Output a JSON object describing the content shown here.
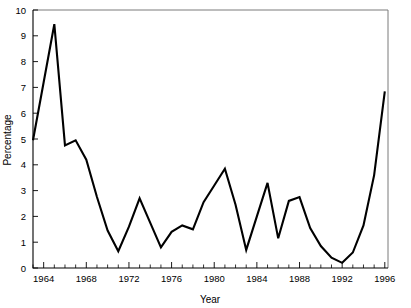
{
  "chart_data": {
    "type": "line",
    "title": "",
    "xlabel": "Year",
    "ylabel": "Percentage",
    "xlim": [
      1963,
      1996.3
    ],
    "ylim": [
      0,
      10
    ],
    "grid": false,
    "legend": "none",
    "x_major_ticks": [
      1964,
      1968,
      1972,
      1976,
      1980,
      1984,
      1988,
      1992,
      1996
    ],
    "x_tick_labels": [
      "1964",
      "1968",
      "1972",
      "1976",
      "1980",
      "1984",
      "1988",
      "1992",
      "1996"
    ],
    "x_minor_tick_interval": 1,
    "y_ticks": [
      0,
      1,
      2,
      3,
      4,
      5,
      6,
      7,
      8,
      9,
      10
    ],
    "y_tick_labels": [
      "0",
      "1",
      "2",
      "3",
      "4",
      "5",
      "6",
      "7",
      "8",
      "9",
      "10"
    ],
    "line_color": "#000000",
    "frame_color": "#7a7a7a",
    "background_color": "#ffffff",
    "x": [
      1963,
      1964,
      1965,
      1966,
      1967,
      1968,
      1969,
      1970,
      1971,
      1972,
      1973,
      1974,
      1975,
      1976,
      1977,
      1978,
      1979,
      1980,
      1981,
      1982,
      1983,
      1984,
      1985,
      1986,
      1987,
      1988,
      1989,
      1990,
      1991,
      1992,
      1993,
      1994,
      1995,
      1996
    ],
    "values": [
      4.95,
      7.2,
      9.45,
      4.75,
      4.95,
      4.2,
      2.75,
      1.45,
      0.65,
      1.6,
      2.7,
      1.75,
      0.8,
      1.4,
      1.65,
      1.5,
      2.55,
      3.2,
      3.85,
      2.45,
      0.7,
      2.0,
      3.3,
      1.15,
      2.6,
      2.75,
      1.55,
      0.85,
      0.4,
      0.2,
      0.6,
      1.65,
      3.6,
      6.85
    ],
    "series": [
      {
        "name": "Percentage",
        "values": [
          4.95,
          7.2,
          9.45,
          4.75,
          4.95,
          4.2,
          2.75,
          1.45,
          0.65,
          1.6,
          2.7,
          1.75,
          0.8,
          1.4,
          1.65,
          1.5,
          2.55,
          3.2,
          3.85,
          2.45,
          0.7,
          2.0,
          3.3,
          1.15,
          2.6,
          2.75,
          1.55,
          0.85,
          0.4,
          0.2,
          0.6,
          1.65,
          3.6,
          6.85
        ]
      }
    ]
  },
  "axes": {
    "y_title": "Percentage",
    "x_title": "Year"
  }
}
